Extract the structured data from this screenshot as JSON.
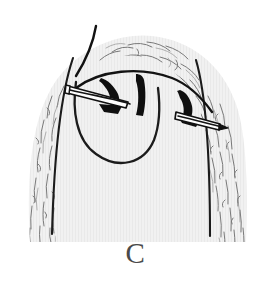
{
  "figure": {
    "panel_label": "C",
    "alt_description": "Line drawing of a hair-bearing scalp dome with a U-shaped flap outline, two curved suture needles and thread passed through the wound edge",
    "label_color": "#4a4a4a"
  },
  "colors": {
    "background": "#ffffff",
    "skin_fill": "#f0f0f0",
    "skin_fill_alt": "#ebebeb",
    "ink": "#111111",
    "ink_soft": "#3a3a3a",
    "hair_stroke": "#5a5a5a",
    "hair_stroke_light": "#8a8a8a",
    "needle_fill": "#ffffff",
    "needle_edge": "#111111"
  },
  "elements": {
    "scalp_dome": "scalp-dome",
    "hair_texture": "hair-texture",
    "flap_outline": "flap-outline",
    "left_relaxing_incision": "left-relaxing-incision",
    "right_relaxing_incision": "right-relaxing-incision",
    "suture_thread": "suture-thread",
    "needle_left": "needle-left",
    "needle_right": "needle-right",
    "staple_left": "staple-left",
    "staple_right": "staple-right"
  },
  "geometry": {
    "canvas_width": 271,
    "canvas_height": 281,
    "dome_top_y": 40,
    "dome_base_y": 242,
    "dome_left_x": 22,
    "dome_right_x": 255
  }
}
